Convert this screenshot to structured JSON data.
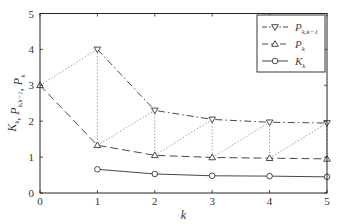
{
  "chart_data": {
    "type": "line",
    "title": "",
    "xlabel": "k",
    "ylabel": "K_k, P_{k,k-1}, P_k",
    "x": [
      0,
      1,
      2,
      3,
      4,
      5
    ],
    "xlim": [
      0,
      5
    ],
    "ylim": [
      0,
      5
    ],
    "xticks": [
      0,
      1,
      2,
      3,
      4,
      5
    ],
    "yticks": [
      0,
      1,
      2,
      3,
      4,
      5
    ],
    "grid": false,
    "legend_position": "upper right",
    "series": [
      {
        "name": "P_{k,k-1}",
        "label_main": "P",
        "label_sub": "k,k−1",
        "marker": "triangle-down",
        "line_style": "dash-dot",
        "x": [
          1,
          2,
          3,
          4,
          5
        ],
        "values": [
          4.0,
          2.3,
          2.05,
          1.97,
          1.95
        ]
      },
      {
        "name": "P_k",
        "label_main": "P",
        "label_sub": "k",
        "marker": "triangle-up",
        "line_style": "dashed",
        "x": [
          0,
          1,
          2,
          3,
          4,
          5
        ],
        "values": [
          3.0,
          1.33,
          1.05,
          0.99,
          0.97,
          0.95
        ]
      },
      {
        "name": "K_k",
        "label_main": "K",
        "label_sub": "k",
        "marker": "circle",
        "line_style": "solid",
        "x": [
          1,
          2,
          3,
          4,
          5
        ],
        "values": [
          0.66,
          0.53,
          0.48,
          0.47,
          0.45
        ]
      }
    ],
    "annotations": "Dotted connectors: P_{k-1} → P_{k,k-1} (prediction step) and vertical P_{k,k-1} → P_k (update step)"
  },
  "colors": {
    "line": "#333333",
    "dotted": "#888888",
    "axis": "#222222"
  }
}
